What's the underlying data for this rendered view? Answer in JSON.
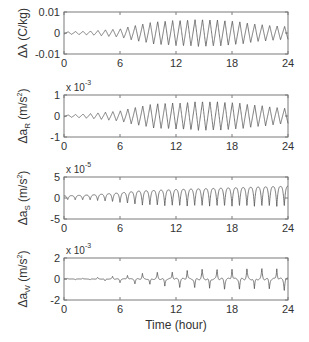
{
  "figure": {
    "xlabel": "Time (hour)",
    "line_color": "#555555",
    "axis_color": "#7a7a7a"
  },
  "chart_data": [
    {
      "type": "line",
      "title": "",
      "ylabel": "Δλ (C/kg)",
      "ylabel_parts": {
        "delta": "Δλ",
        "rest": " (C/kg)"
      },
      "xlabel": "",
      "xlim": [
        0,
        24
      ],
      "xticks": [
        0,
        6,
        12,
        18,
        24
      ],
      "xtick_labels": [
        "0",
        "6",
        "12",
        "18",
        "24"
      ],
      "ylim": [
        -0.01,
        0.01
      ],
      "yticks": [
        -0.01,
        0,
        0.01
      ],
      "ytick_labels": [
        "-0.01",
        "0",
        "0.01"
      ],
      "scale_note": "",
      "grid": false,
      "series": [
        {
          "name": "Δλ",
          "shape": "sawtooth",
          "period_hours": 0.8,
          "amplitude_envelope": [
            [
              0,
              0.0005
            ],
            [
              3,
              0.001
            ],
            [
              6,
              0.002
            ],
            [
              8,
              0.004
            ],
            [
              10,
              0.0055
            ],
            [
              12,
              0.006
            ],
            [
              15,
              0.0065
            ],
            [
              18,
              0.0058
            ],
            [
              21,
              0.004
            ],
            [
              24,
              0.003
            ]
          ]
        }
      ]
    },
    {
      "type": "line",
      "ylabel": "Δa_R (m/s²)",
      "ylabel_parts": {
        "delta": "Δa",
        "sub": "R",
        "rest": " (m/s",
        "sup": "2",
        "close": ")"
      },
      "xlim": [
        0,
        24
      ],
      "xticks": [
        0,
        6,
        12,
        18,
        24
      ],
      "xtick_labels": [
        "0",
        "6",
        "12",
        "18",
        "24"
      ],
      "ylim": [
        -1,
        1
      ],
      "yticks": [
        -1,
        0,
        1
      ],
      "ytick_labels": [
        "-1",
        "0",
        "1"
      ],
      "scale_note": "x 10",
      "scale_exp": "-3",
      "grid": false,
      "series": [
        {
          "name": "Δa_R",
          "shape": "sawtooth",
          "period_hours": 0.8,
          "amplitude_envelope": [
            [
              0,
              0.04
            ],
            [
              3,
              0.12
            ],
            [
              6,
              0.25
            ],
            [
              8,
              0.45
            ],
            [
              10,
              0.6
            ],
            [
              12,
              0.62
            ],
            [
              15,
              0.7
            ],
            [
              18,
              0.65
            ],
            [
              21,
              0.5
            ],
            [
              24,
              0.35
            ]
          ]
        }
      ]
    },
    {
      "type": "line",
      "ylabel": "Δa_S (m/s²)",
      "ylabel_parts": {
        "delta": "Δa",
        "sub": "S",
        "rest": " (m/s",
        "sup": "2",
        "close": ")"
      },
      "xlim": [
        0,
        24
      ],
      "xticks": [
        0,
        6,
        12,
        18,
        24
      ],
      "xtick_labels": [
        "0",
        "6",
        "12",
        "18",
        "24"
      ],
      "ylim": [
        -5,
        5
      ],
      "yticks": [
        -5,
        0,
        5
      ],
      "ytick_labels": [
        "-5",
        "0",
        "5"
      ],
      "scale_note": "x 10",
      "scale_exp": "-5",
      "grid": false,
      "series": [
        {
          "name": "Δa_S",
          "shape": "cusp-down",
          "period_hours": 0.8,
          "offset_envelope": [
            [
              0,
              0.2
            ],
            [
              24,
              1.2
            ]
          ],
          "amplitude_envelope": [
            [
              0,
              0.6
            ],
            [
              3,
              0.8
            ],
            [
              6,
              1.5
            ],
            [
              8,
              2.2
            ],
            [
              12,
              2.6
            ],
            [
              18,
              2.9
            ],
            [
              24,
              3.2
            ]
          ]
        }
      ]
    },
    {
      "type": "line",
      "ylabel": "Δa_W (m/s²)",
      "ylabel_parts": {
        "delta": "Δa",
        "sub": "W",
        "rest": " (m/s",
        "sup": "2",
        "close": ")"
      },
      "xlabel": "Time (hour)",
      "xlim": [
        0,
        24
      ],
      "xticks": [
        0,
        6,
        12,
        18,
        24
      ],
      "xtick_labels": [
        "0",
        "6",
        "12",
        "18",
        "24"
      ],
      "ylim": [
        -2,
        2
      ],
      "yticks": [
        -2,
        0,
        2
      ],
      "ytick_labels": [
        "-2",
        "0",
        "2"
      ],
      "scale_note": "x 10",
      "scale_exp": "-3",
      "grid": false,
      "series": [
        {
          "name": "Δa_W",
          "shape": "spikes",
          "period_hours": 1.6,
          "amplitude_envelope": [
            [
              0,
              0.05
            ],
            [
              3,
              0.1
            ],
            [
              5,
              0.25
            ],
            [
              8,
              0.5
            ],
            [
              11,
              0.7
            ],
            [
              14,
              0.9
            ],
            [
              18,
              1.0
            ],
            [
              22,
              1.0
            ],
            [
              24,
              1.1
            ]
          ]
        }
      ]
    }
  ]
}
